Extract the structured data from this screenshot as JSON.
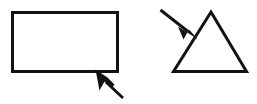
{
  "canvas": {
    "width": 257,
    "height": 104,
    "background_color": "#ffffff",
    "stroke_color": "#121212",
    "stroke_width": 3
  },
  "figure": {
    "title": ""
  },
  "shapes": [
    {
      "name": "rectangle",
      "kind": "rectangle",
      "x": 11,
      "y": 11,
      "width": 108,
      "height": 62,
      "fill": "none",
      "stroke": "#121212",
      "label": ""
    },
    {
      "name": "triangle",
      "kind": "triangle",
      "points": "211,11 248,73 172,73",
      "fill": "none",
      "stroke": "#121212",
      "label": ""
    }
  ],
  "arrows": [
    {
      "name": "rectangle-pointer",
      "style": "mouse-cursor",
      "direction": "up-left",
      "tip": {
        "x": 96,
        "y": 70
      },
      "tail": {
        "x": 123,
        "y": 98
      },
      "shaft_path": "M 107 83 L 123 98",
      "head_path": "M 96 70 L 100 89 L 105 82 L 111 88 L 113 83 L 107 78 Z",
      "color": "#121212"
    },
    {
      "name": "triangle-pointer",
      "style": "solid-triangle",
      "direction": "down-right",
      "tip": {
        "x": 197,
        "y": 39
      },
      "tail": {
        "x": 160,
        "y": 10
      },
      "shaft_path": "M 160 10 L 187 31",
      "head_path": "M 197 39 L 179 27 L 184 38 L 189 29 Z",
      "color": "#121212"
    }
  ]
}
